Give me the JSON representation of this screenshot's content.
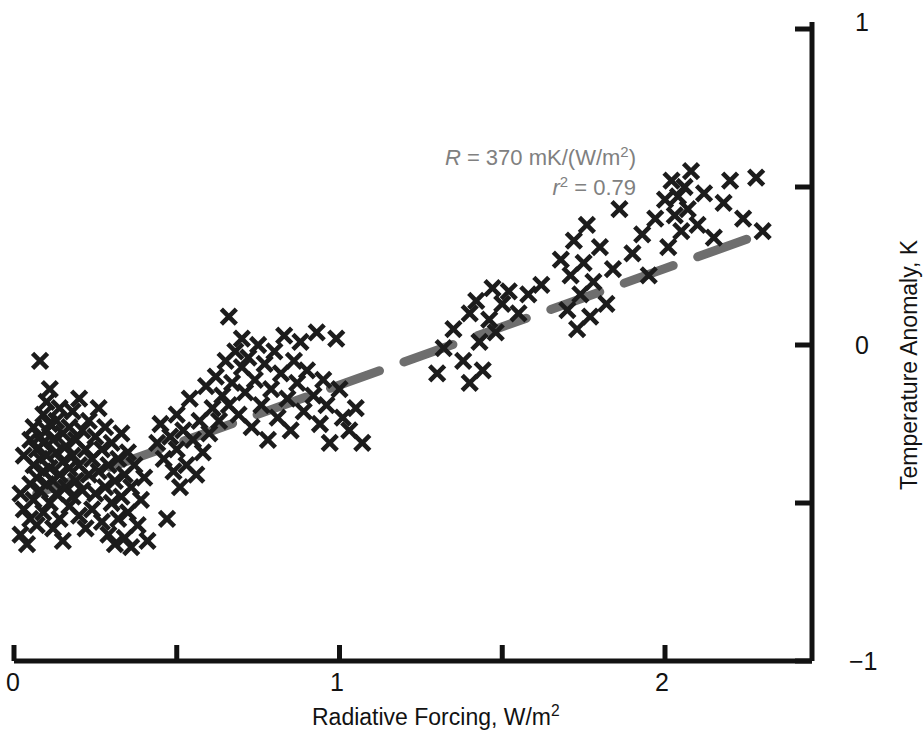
{
  "chart_data": {
    "type": "scatter",
    "title": "",
    "xlabel": "Radiative Forcing, W/m²",
    "ylabel": "Temperature Anomaly, K",
    "xlim": [
      0,
      2.45
    ],
    "ylim": [
      -1,
      1
    ],
    "grid": false,
    "legend": null,
    "x_ticks_major": [
      0,
      1,
      2
    ],
    "x_tick_labels": [
      "0",
      "1",
      "2"
    ],
    "x_ticks_minor": [
      0.5,
      1.5
    ],
    "y_ticks_major": [
      -1,
      0,
      1
    ],
    "y_tick_labels": [
      "−1",
      "0",
      "1"
    ],
    "y_ticks_minor": [
      -0.5,
      0.5
    ],
    "y_axis_side": "right",
    "marker": "x",
    "marker_color": "#1c1c1c",
    "marker_size_px": 15,
    "series": [
      {
        "name": "observations",
        "points": [
          [
            0.02,
            -0.47
          ],
          [
            0.02,
            -0.6
          ],
          [
            0.03,
            -0.35
          ],
          [
            0.03,
            -0.52
          ],
          [
            0.04,
            -0.63
          ],
          [
            0.05,
            -0.3
          ],
          [
            0.05,
            -0.44
          ],
          [
            0.05,
            -0.55
          ],
          [
            0.06,
            -0.26
          ],
          [
            0.06,
            -0.38
          ],
          [
            0.06,
            -0.49
          ],
          [
            0.07,
            -0.33
          ],
          [
            0.07,
            -0.42
          ],
          [
            0.07,
            -0.57
          ],
          [
            0.08,
            -0.05
          ],
          [
            0.08,
            -0.29
          ],
          [
            0.08,
            -0.36
          ],
          [
            0.08,
            -0.46
          ],
          [
            0.09,
            -0.22
          ],
          [
            0.09,
            -0.31
          ],
          [
            0.09,
            -0.4
          ],
          [
            0.09,
            -0.53
          ],
          [
            0.1,
            -0.18
          ],
          [
            0.1,
            -0.27
          ],
          [
            0.1,
            -0.35
          ],
          [
            0.1,
            -0.44
          ],
          [
            0.11,
            -0.14
          ],
          [
            0.11,
            -0.25
          ],
          [
            0.11,
            -0.39
          ],
          [
            0.11,
            -0.5
          ],
          [
            0.12,
            -0.3
          ],
          [
            0.12,
            -0.43
          ],
          [
            0.12,
            -0.58
          ],
          [
            0.13,
            -0.24
          ],
          [
            0.13,
            -0.34
          ],
          [
            0.13,
            -0.47
          ],
          [
            0.14,
            -0.2
          ],
          [
            0.14,
            -0.41
          ],
          [
            0.14,
            -0.55
          ],
          [
            0.15,
            -0.28
          ],
          [
            0.15,
            -0.37
          ],
          [
            0.15,
            -0.62
          ],
          [
            0.16,
            -0.32
          ],
          [
            0.16,
            -0.45
          ],
          [
            0.17,
            -0.26
          ],
          [
            0.17,
            -0.39
          ],
          [
            0.17,
            -0.51
          ],
          [
            0.18,
            -0.21
          ],
          [
            0.18,
            -0.35
          ],
          [
            0.18,
            -0.48
          ],
          [
            0.19,
            -0.3
          ],
          [
            0.19,
            -0.43
          ],
          [
            0.2,
            -0.17
          ],
          [
            0.2,
            -0.38
          ],
          [
            0.2,
            -0.54
          ],
          [
            0.21,
            -0.27
          ],
          [
            0.21,
            -0.46
          ],
          [
            0.22,
            -0.33
          ],
          [
            0.22,
            -0.58
          ],
          [
            0.23,
            -0.24
          ],
          [
            0.23,
            -0.41
          ],
          [
            0.24,
            -0.36
          ],
          [
            0.24,
            -0.52
          ],
          [
            0.25,
            -0.29
          ],
          [
            0.25,
            -0.47
          ],
          [
            0.26,
            -0.2
          ],
          [
            0.26,
            -0.4
          ],
          [
            0.27,
            -0.33
          ],
          [
            0.27,
            -0.56
          ],
          [
            0.28,
            -0.26
          ],
          [
            0.28,
            -0.45
          ],
          [
            0.29,
            -0.38
          ],
          [
            0.29,
            -0.6
          ],
          [
            0.3,
            -0.31
          ],
          [
            0.3,
            -0.5
          ],
          [
            0.31,
            -0.43
          ],
          [
            0.31,
            -0.63
          ],
          [
            0.32,
            -0.36
          ],
          [
            0.32,
            -0.55
          ],
          [
            0.33,
            -0.28
          ],
          [
            0.33,
            -0.48
          ],
          [
            0.34,
            -0.41
          ],
          [
            0.34,
            -0.61
          ],
          [
            0.35,
            -0.34
          ],
          [
            0.35,
            -0.53
          ],
          [
            0.36,
            -0.45
          ],
          [
            0.36,
            -0.64
          ],
          [
            0.37,
            -0.38
          ],
          [
            0.38,
            -0.57
          ],
          [
            0.39,
            -0.49
          ],
          [
            0.4,
            -0.42
          ],
          [
            0.41,
            -0.62
          ],
          [
            0.44,
            -0.31
          ],
          [
            0.45,
            -0.25
          ],
          [
            0.46,
            -0.36
          ],
          [
            0.47,
            -0.55
          ],
          [
            0.48,
            -0.29
          ],
          [
            0.49,
            -0.4
          ],
          [
            0.5,
            -0.22
          ],
          [
            0.5,
            -0.33
          ],
          [
            0.51,
            -0.45
          ],
          [
            0.52,
            -0.27
          ],
          [
            0.53,
            -0.38
          ],
          [
            0.54,
            -0.17
          ],
          [
            0.55,
            -0.3
          ],
          [
            0.56,
            -0.41
          ],
          [
            0.57,
            -0.24
          ],
          [
            0.58,
            -0.34
          ],
          [
            0.59,
            -0.13
          ],
          [
            0.6,
            -0.28
          ],
          [
            0.61,
            -0.2
          ],
          [
            0.62,
            -0.1
          ],
          [
            0.63,
            -0.24
          ],
          [
            0.64,
            -0.16
          ],
          [
            0.65,
            -0.05
          ],
          [
            0.66,
            -0.19
          ],
          [
            0.66,
            0.09
          ],
          [
            0.67,
            -0.12
          ],
          [
            0.68,
            -0.02
          ],
          [
            0.69,
            -0.22
          ],
          [
            0.7,
            -0.07
          ],
          [
            0.7,
            0.02
          ],
          [
            0.71,
            -0.15
          ],
          [
            0.72,
            -0.04
          ],
          [
            0.73,
            -0.26
          ],
          [
            0.74,
            -0.11
          ],
          [
            0.75,
            0.0
          ],
          [
            0.76,
            -0.19
          ],
          [
            0.77,
            -0.06
          ],
          [
            0.78,
            -0.3
          ],
          [
            0.79,
            -0.14
          ],
          [
            0.8,
            -0.02
          ],
          [
            0.81,
            -0.23
          ],
          [
            0.82,
            -0.09
          ],
          [
            0.83,
            0.03
          ],
          [
            0.84,
            -0.17
          ],
          [
            0.85,
            -0.27
          ],
          [
            0.86,
            -0.05
          ],
          [
            0.87,
            -0.12
          ],
          [
            0.88,
            0.01
          ],
          [
            0.89,
            -0.21
          ],
          [
            0.9,
            -0.08
          ],
          [
            0.92,
            -0.16
          ],
          [
            0.93,
            0.04
          ],
          [
            0.94,
            -0.25
          ],
          [
            0.95,
            -0.11
          ],
          [
            0.96,
            -0.19
          ],
          [
            0.97,
            -0.31
          ],
          [
            0.99,
            0.02
          ],
          [
            1.0,
            -0.14
          ],
          [
            1.01,
            -0.23
          ],
          [
            1.03,
            -0.27
          ],
          [
            1.05,
            -0.2
          ],
          [
            1.07,
            -0.31
          ],
          [
            1.3,
            -0.09
          ],
          [
            1.32,
            -0.01
          ],
          [
            1.35,
            0.05
          ],
          [
            1.38,
            -0.05
          ],
          [
            1.4,
            0.1
          ],
          [
            1.4,
            -0.12
          ],
          [
            1.42,
            0.14
          ],
          [
            1.43,
            0.01
          ],
          [
            1.44,
            -0.08
          ],
          [
            1.46,
            0.08
          ],
          [
            1.47,
            0.18
          ],
          [
            1.48,
            0.04
          ],
          [
            1.5,
            0.13
          ],
          [
            1.52,
            0.17
          ],
          [
            1.55,
            0.1
          ],
          [
            1.58,
            0.16
          ],
          [
            1.62,
            0.19
          ],
          [
            1.68,
            0.27
          ],
          [
            1.7,
            0.11
          ],
          [
            1.71,
            0.22
          ],
          [
            1.72,
            0.33
          ],
          [
            1.73,
            0.05
          ],
          [
            1.74,
            0.16
          ],
          [
            1.75,
            0.26
          ],
          [
            1.76,
            0.38
          ],
          [
            1.77,
            0.09
          ],
          [
            1.78,
            0.2
          ],
          [
            1.8,
            0.31
          ],
          [
            1.82,
            0.13
          ],
          [
            1.84,
            0.24
          ],
          [
            1.86,
            0.43
          ],
          [
            1.9,
            0.29
          ],
          [
            1.93,
            0.35
          ],
          [
            1.95,
            0.22
          ],
          [
            1.97,
            0.4
          ],
          [
            2.0,
            0.46
          ],
          [
            2.01,
            0.31
          ],
          [
            2.02,
            0.52
          ],
          [
            2.03,
            0.41
          ],
          [
            2.04,
            0.47
          ],
          [
            2.05,
            0.36
          ],
          [
            2.06,
            0.5
          ],
          [
            2.07,
            0.43
          ],
          [
            2.08,
            0.55
          ],
          [
            2.1,
            0.38
          ],
          [
            2.12,
            0.48
          ],
          [
            2.15,
            0.34
          ],
          [
            2.18,
            0.45
          ],
          [
            2.2,
            0.52
          ],
          [
            2.24,
            0.4
          ],
          [
            2.28,
            0.53
          ],
          [
            2.3,
            0.36
          ]
        ]
      }
    ],
    "trendline": {
      "style": "dashed",
      "color": "#6e6e6e",
      "width_px": 9,
      "x_start": 0.07,
      "y_start": -0.47,
      "x_end": 2.32,
      "y_end": 0.36,
      "slope_mK_per_Wm2": 370,
      "r_squared": 0.79
    },
    "annotations": [
      {
        "name": "sensitivity",
        "text": "R = 370 mK/(W/m²)"
      },
      {
        "name": "r-squared",
        "text": "r² = 0.79"
      }
    ]
  },
  "axes": {
    "x_title": "Radiative Forcing, W/m",
    "x_title_sup": "2",
    "y_title": "Temperature Anomaly, K",
    "x_labels": [
      "0",
      "1",
      "2"
    ],
    "y_labels": [
      "1",
      "0",
      "−1"
    ]
  },
  "annotation": {
    "r_symbol": "R",
    "r_equals": " = 370 mK/(W/m",
    "r_sup": "2",
    "r_close": ")",
    "r2_symbol": "r",
    "r2_sup": "2",
    "r2_value": " = 0.79"
  },
  "colors": {
    "axis": "#121212",
    "marker": "#1c1c1c",
    "trendline": "#6e6e6e",
    "annotation_text": "#808080",
    "background": "#ffffff"
  }
}
